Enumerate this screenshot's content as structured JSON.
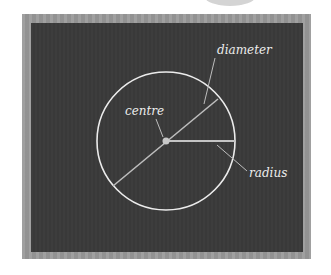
{
  "diagram": {
    "labels": {
      "diameter": "diameter",
      "centre": "centre",
      "radius": "radius"
    },
    "colors": {
      "board": "#3a3a3a",
      "frame": "#9a9a9a",
      "chalk": "#ececec",
      "line": "#bdbdbd"
    },
    "circle": {
      "cx": 166,
      "cy": 141,
      "r": 69
    }
  }
}
